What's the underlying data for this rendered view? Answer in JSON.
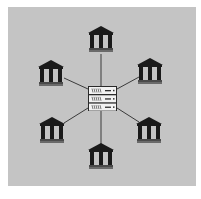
{
  "diagram": {
    "title": "",
    "background_color": "#c4c4c4",
    "line_color": "#3a3a3a",
    "icon_color": "#1a1a1a",
    "hub": {
      "type": "server-rack",
      "units": 3,
      "x": 88,
      "y": 86,
      "w": 29,
      "h": 25,
      "cx": 102,
      "cy": 98
    },
    "nodes": [
      {
        "id": "bank-top",
        "type": "bank-building",
        "x": 88,
        "y": 26,
        "anchor": [
          101,
          54
        ]
      },
      {
        "id": "bank-upper-left",
        "type": "bank-building",
        "x": 38,
        "y": 60,
        "anchor": [
          64,
          78
        ]
      },
      {
        "id": "bank-upper-right",
        "type": "bank-building",
        "x": 137,
        "y": 58,
        "anchor": [
          139,
          77
        ]
      },
      {
        "id": "bank-lower-left",
        "type": "bank-building",
        "x": 39,
        "y": 117,
        "anchor": [
          64,
          123
        ]
      },
      {
        "id": "bank-lower-right",
        "type": "bank-building",
        "x": 136,
        "y": 117,
        "anchor": [
          139,
          122
        ]
      },
      {
        "id": "bank-bottom",
        "type": "bank-building",
        "x": 88,
        "y": 143,
        "anchor": [
          101,
          144
        ]
      }
    ],
    "edges": [
      {
        "from": "hub",
        "to": "bank-top",
        "hub_point": [
          101,
          86
        ]
      },
      {
        "from": "hub",
        "to": "bank-upper-left",
        "hub_point": [
          88,
          89
        ]
      },
      {
        "from": "hub",
        "to": "bank-upper-right",
        "hub_point": [
          117,
          89
        ]
      },
      {
        "from": "hub",
        "to": "bank-lower-left",
        "hub_point": [
          88,
          108
        ]
      },
      {
        "from": "hub",
        "to": "bank-lower-right",
        "hub_point": [
          117,
          108
        ]
      },
      {
        "from": "hub",
        "to": "bank-bottom",
        "hub_point": [
          101,
          111
        ]
      }
    ]
  }
}
